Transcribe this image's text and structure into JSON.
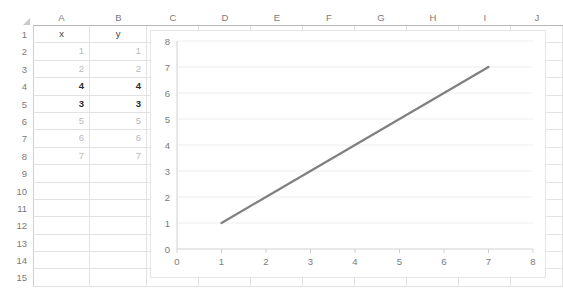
{
  "spreadsheet": {
    "columns": [
      "A",
      "B",
      "C",
      "D",
      "E",
      "F",
      "G",
      "H",
      "I",
      "J"
    ],
    "rows": [
      "1",
      "2",
      "3",
      "4",
      "5",
      "6",
      "7",
      "8",
      "9",
      "10",
      "11",
      "12",
      "13",
      "14",
      "15"
    ],
    "headers": {
      "a": "x",
      "b": "y"
    },
    "data": [
      {
        "row": "2",
        "a": "1",
        "b": "1",
        "bold": false
      },
      {
        "row": "3",
        "a": "2",
        "b": "2",
        "bold": false
      },
      {
        "row": "4",
        "a": "4",
        "b": "4",
        "bold": true
      },
      {
        "row": "5",
        "a": "3",
        "b": "3",
        "bold": true
      },
      {
        "row": "6",
        "a": "5",
        "b": "5",
        "bold": false
      },
      {
        "row": "7",
        "a": "6",
        "b": "6",
        "bold": false
      },
      {
        "row": "8",
        "a": "7",
        "b": "7",
        "bold": false
      }
    ],
    "grid_line_color": "#e2e2e2",
    "header_text_color": "#7a7a7a"
  },
  "chart_data": {
    "type": "line",
    "title": "",
    "xlabel": "",
    "ylabel": "",
    "x": [
      1,
      2,
      4,
      3,
      5,
      6,
      7
    ],
    "series": [
      {
        "name": "y",
        "values": [
          1,
          2,
          4,
          3,
          5,
          6,
          7
        ],
        "color": "#808080"
      }
    ],
    "xlim": [
      0,
      8
    ],
    "ylim": [
      0,
      8
    ],
    "xticks": [
      "0",
      "1",
      "2",
      "3",
      "4",
      "5",
      "6",
      "7",
      "8"
    ],
    "yticks": [
      "0",
      "1",
      "2",
      "3",
      "4",
      "5",
      "6",
      "7",
      "8"
    ],
    "grid": "horizontal",
    "legend": "none",
    "gridline_color": "#ededed",
    "axis_color": "#d0d0d0",
    "tick_label_color": "#7a7a7a"
  }
}
